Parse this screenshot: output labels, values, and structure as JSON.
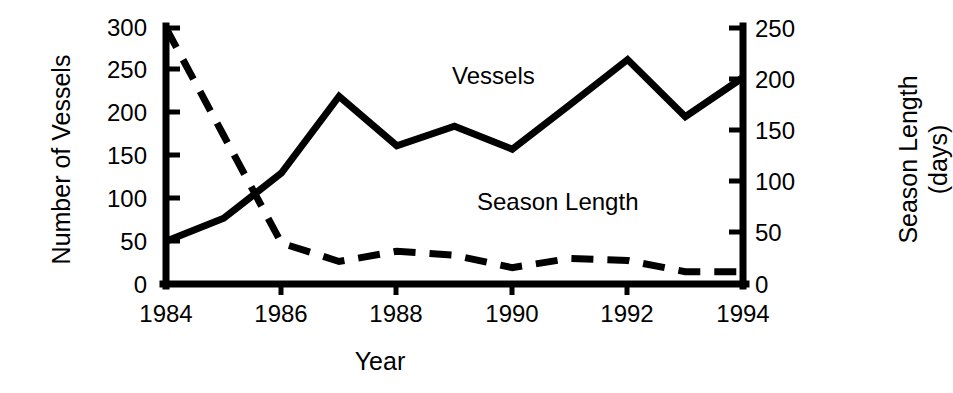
{
  "chart_data": {
    "type": "line",
    "title": "",
    "xlabel": "Year",
    "ylabel": "Number of Vessels",
    "y2label": "Season Length (days)",
    "grid": false,
    "legend_position": "inline-annotation",
    "x": [
      1984,
      1985,
      1986,
      1987,
      1988,
      1989,
      1990,
      1991,
      1992,
      1993,
      1994
    ],
    "xlim": [
      1984,
      1994
    ],
    "xticks": [
      1984,
      1986,
      1988,
      1990,
      1992,
      1994
    ],
    "xticklabels": [
      "1984",
      "1986",
      "1988",
      "1990",
      "1992",
      "1994"
    ],
    "ylim": [
      0,
      300
    ],
    "yticks": [
      0,
      50,
      100,
      150,
      200,
      250,
      300
    ],
    "yticklabels": [
      "0",
      "50",
      "100",
      "150",
      "200",
      "250",
      "300"
    ],
    "y2lim": [
      0,
      250
    ],
    "y2ticks": [
      0,
      50,
      100,
      150,
      200,
      250
    ],
    "y2ticklabels": [
      "0",
      "50",
      "100",
      "150",
      "200",
      "250"
    ],
    "series": [
      {
        "name": "Vessels",
        "axis": "left",
        "style": "solid",
        "color": "#000000",
        "label_text": "Vessels",
        "values": [
          50,
          77,
          130,
          220,
          162,
          185,
          158,
          210,
          263,
          196,
          242
        ]
      },
      {
        "name": "Season Length",
        "axis": "right",
        "style": "dashed",
        "color": "#000000",
        "label_text": "Season Length",
        "values": [
          250,
          145,
          40,
          22,
          32,
          28,
          16,
          25,
          23,
          12,
          12
        ]
      }
    ],
    "annotations": [
      {
        "text": "Vessels",
        "x": 1988.0,
        "y_axis": "left",
        "y": 265
      },
      {
        "text": "Season Length",
        "x": 1989.6,
        "y_axis": "left",
        "y": 108
      }
    ]
  },
  "axes": {
    "left_title": "Number of Vessels",
    "right_title_line1": "Season Length",
    "right_title_line2": "(days)",
    "x_title": "Year"
  },
  "labels": {
    "vessels": "Vessels",
    "season_length": "Season Length"
  }
}
